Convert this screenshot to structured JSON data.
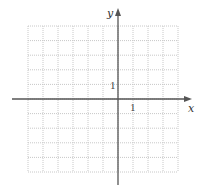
{
  "chart_data": {
    "type": "scatter",
    "title": "",
    "xlabel": "x",
    "ylabel": "y",
    "x": [],
    "y": [],
    "xlim": [
      -6,
      4
    ],
    "ylim": [
      -5,
      5
    ],
    "grid": true,
    "grid_style": "dotted",
    "tick_labels": {
      "x": [
        "1"
      ],
      "y": [
        "1"
      ]
    },
    "legend": null
  },
  "axes": {
    "x_label": "x",
    "y_label": "y",
    "x_unit_label": "1",
    "y_unit_label": "1"
  },
  "colors": {
    "axis": "#555555",
    "grid": "#c8c8c8",
    "text": "#333333",
    "background": "#ffffff"
  }
}
